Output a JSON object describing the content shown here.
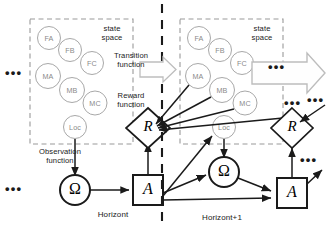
{
  "diagram": {
    "colors": {
      "node_stroke": "#a8a8a8",
      "box_stroke": "#1a1a1a",
      "dashed_box": "#9a9a9a",
      "divider": "#1a1a1a",
      "block_arrow": "#bdbdbd",
      "arrow": "#1a1a1a",
      "text": "#1a1a1a",
      "node_text": "#8a8a8a"
    },
    "panels": [
      {
        "id": "horizont",
        "time_label": "Horizont",
        "state_space_label": "state\nspace",
        "state_nodes": [
          {
            "label": "FA"
          },
          {
            "label": "FB"
          },
          {
            "label": "FC"
          },
          {
            "label": "MA"
          },
          {
            "label": "MB"
          },
          {
            "label": "MC"
          },
          {
            "label": "Loc"
          }
        ],
        "reward_node": "R",
        "action_node": "A",
        "observation_node": "Ω"
      },
      {
        "id": "horizont-plus-1",
        "time_label": "Horizont+1",
        "state_space_label": "state\nspace",
        "state_nodes": [
          {
            "label": "FA"
          },
          {
            "label": "FB"
          },
          {
            "label": "FC"
          },
          {
            "label": "MA"
          },
          {
            "label": "MB"
          },
          {
            "label": "MC"
          },
          {
            "label": "Loc"
          }
        ],
        "reward_node": "R",
        "action_node": "A",
        "observation_node": "Ω"
      }
    ],
    "function_labels": [
      {
        "id": "transition",
        "text": "Transition\nfunction"
      },
      {
        "id": "reward",
        "text": "Reward\nfunction"
      },
      {
        "id": "observation",
        "text": "Observation\nfunction"
      }
    ],
    "ellipses": [
      {
        "id": "left-state-ellipsis",
        "text": "•••"
      },
      {
        "id": "left-bottom-ellipsis",
        "text": "•••"
      },
      {
        "id": "right-blockarrow-ellipsis",
        "text": "•••"
      },
      {
        "id": "right-reward-ellipsis",
        "text": "•••"
      },
      {
        "id": "right-action-ellipsis",
        "text": "•••"
      },
      {
        "id": "right-edge-ellipsis",
        "text": "•••"
      }
    ]
  }
}
